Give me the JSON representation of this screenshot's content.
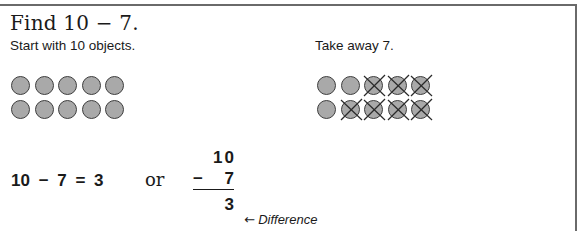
{
  "title": "Find 10 − 7.",
  "left_panel": {
    "instruction": "Start with 10 objects.",
    "rows": [
      [
        false,
        false,
        false,
        false,
        false
      ],
      [
        false,
        false,
        false,
        false,
        false
      ]
    ],
    "object_count": 10
  },
  "right_panel": {
    "instruction": "Take away 7.",
    "rows": [
      [
        false,
        false,
        true,
        true,
        true
      ],
      [
        false,
        true,
        true,
        true,
        true
      ]
    ],
    "crossed_out_count": 7
  },
  "equation": {
    "horizontal": "10 − 7 = 3",
    "connector": "or",
    "vertical": {
      "minuend": "10",
      "operator": "−",
      "subtrahend": "7",
      "result": "3"
    },
    "result_arrow": "←",
    "result_label": "Difference"
  },
  "colors": {
    "object_fill": "#a9a9a9",
    "object_stroke": "#3e3e3e",
    "frame": "#6a6a6a",
    "text": "#1a1a1a"
  }
}
